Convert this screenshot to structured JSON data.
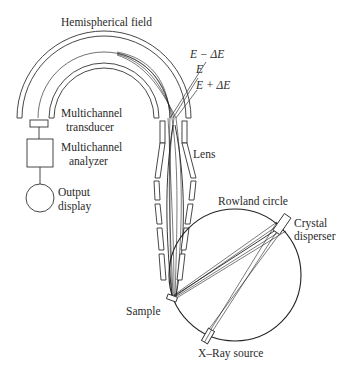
{
  "diagram": {
    "type": "schematic",
    "labels": {
      "hemispherical_field": "Hemispherical field",
      "energy_minus": "E − ΔE",
      "energy": "E",
      "energy_plus": "E + ΔE",
      "transducer_line1": "Multichannel",
      "transducer_line2": "transducer",
      "analyzer_line1": "Multichannel",
      "analyzer_line2": "analyzer",
      "output_line1": "Output",
      "output_line2": "display",
      "lens": "Lens",
      "rowland_circle": "Rowland circle",
      "crystal_line1": "Crystal",
      "crystal_line2": "disperser",
      "sample": "Sample",
      "xray_source": "X–Ray source"
    },
    "components": [
      "Hemispherical field",
      "Multichannel transducer",
      "Multichannel analyzer",
      "Output display",
      "Lens",
      "Rowland circle",
      "Crystal disperser",
      "Sample",
      "X–Ray source"
    ],
    "colors": {
      "line": "#333333",
      "text": "#2a2a2a",
      "background": "#ffffff"
    }
  }
}
